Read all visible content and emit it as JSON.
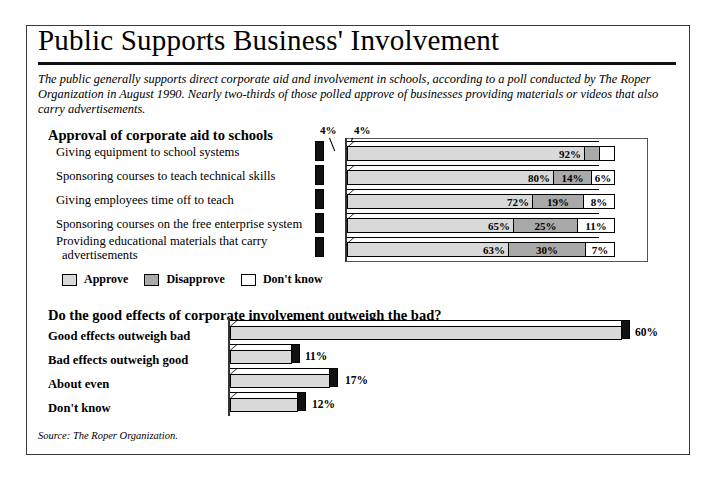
{
  "title": "Public Supports Business' Involvement",
  "intro": "The public generally supports direct corporate aid and involvement in schools, according to a poll conducted by The Roper Organization in August 1990. Nearly two-thirds of those polled approve of businesses providing materials or videos that also carry advertisements.",
  "section1_heading": "Approval of corporate aid to schools",
  "section2_heading": "Do the good effects of corporate involvement outweigh the bad?",
  "legend": {
    "approve": "Approve",
    "disapprove": "Disapprove",
    "dontknow": "Don't know"
  },
  "source": "Source: The Roper Organization.",
  "colors": {
    "approve": "#d9d9d9",
    "disapprove": "#a9a9a9",
    "dontknow": "#ffffff",
    "endcap": "#111111",
    "border": "#000000"
  },
  "callouts": {
    "top_left": "4%",
    "top_right": "4%"
  },
  "chart_data": [
    {
      "type": "bar",
      "stacked": true,
      "title": "Approval of corporate aid to schools",
      "xlabel": "",
      "ylabel": "",
      "xlim": [
        0,
        100
      ],
      "grid": false,
      "legend_position": "bottom-left",
      "legend": [
        "Approve",
        "Disapprove",
        "Don't know"
      ],
      "categories": [
        "Giving equipment to school systems",
        "Sponsoring courses to teach technical skills",
        "Giving employees time off to teach",
        "Sponsoring courses on the free enterprise system",
        "Providing educational materials that carry advertisements"
      ],
      "series": [
        {
          "name": "Approve",
          "values": [
            92,
            80,
            72,
            65,
            63
          ],
          "labels": [
            "92%",
            "80%",
            "72%",
            "65%",
            "63%"
          ]
        },
        {
          "name": "Disapprove",
          "values": [
            4,
            14,
            19,
            25,
            30
          ],
          "labels": [
            "4%",
            "14%",
            "19%",
            "25%",
            "30%"
          ]
        },
        {
          "name": "Don't know",
          "values": [
            4,
            6,
            8,
            11,
            7
          ],
          "labels": [
            "4%",
            "6%",
            "8%",
            "11%",
            "7%"
          ]
        }
      ]
    },
    {
      "type": "bar",
      "stacked": false,
      "orientation": "horizontal",
      "title": "Do the good effects of corporate involvement outweigh the bad?",
      "xlabel": "",
      "ylabel": "",
      "xlim": [
        0,
        60
      ],
      "grid": false,
      "categories": [
        "Good effects outweigh bad",
        "Bad effects outweigh good",
        "About even",
        "Don't know"
      ],
      "values": [
        60,
        11,
        17,
        12
      ],
      "labels": [
        "60%",
        "11%",
        "17%",
        "12%"
      ]
    }
  ]
}
